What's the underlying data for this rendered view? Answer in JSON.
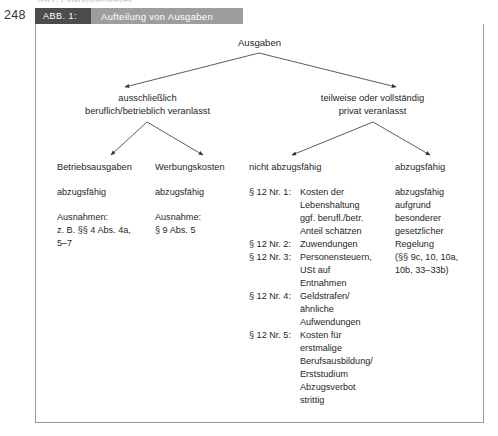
{
  "page": {
    "number": "248",
    "cut_off_line_above": "Teil C  Einkommensteuer"
  },
  "caption": {
    "number_label": "ABB. 1:",
    "title": "Aufteilung von Ausgaben"
  },
  "diagram": {
    "type": "tree",
    "root": "Ausgaben",
    "level1": [
      {
        "label": "ausschließlich\nberuflich/betrieblich veranlasst"
      },
      {
        "label": "teilweise oder vollständig\nprivat veranlasst"
      }
    ],
    "level2": [
      {
        "label": "Betriebsausgaben"
      },
      {
        "label": "Werbungskosten"
      },
      {
        "label": "nicht abzugsfähig"
      },
      {
        "label": "abzugsfähig"
      }
    ],
    "column1": {
      "status": "abzugsfähig",
      "exceptions": "Ausnahmen:\nz. B. §§ 4 Abs. 4a,\n5–7"
    },
    "column2": {
      "status": "abzugsfähig",
      "exceptions": "Ausnahme:\n§ 9 Abs. 5"
    },
    "column3": {
      "items": [
        {
          "key": "§ 12 Nr. 1:",
          "value": "Kosten der\nLebenshaltung\nggf. berufl./betr.\nAnteil schätzen"
        },
        {
          "key": "§ 12 Nr. 2:",
          "value": "Zuwendungen"
        },
        {
          "key": "§ 12 Nr. 3:",
          "value": "Personensteuern,\nUSt auf\nEntnahmen"
        },
        {
          "key": "§ 12 Nr. 4:",
          "value": "Geldstrafen/\nähnliche\nAufwendungen"
        },
        {
          "key": "§ 12 Nr. 5:",
          "value": "Kosten für\nerstmalige\nBerufsausbildung/\nErststudium\nAbzugsverbot\nstrittig"
        }
      ]
    },
    "column4": {
      "text": "abzugsfähig\naufgrund\nbesonderer\ngesetzlicher\nRegelung\n(§§ 9c, 10, 10a,\n10b, 33–33b)"
    }
  },
  "colors": {
    "caption_number_bg": "#4c4c4c",
    "caption_title_bg": "#9d9d9d",
    "frame_border": "#9a9a9a",
    "text": "#262626",
    "arrow": "#3a3a3a"
  }
}
